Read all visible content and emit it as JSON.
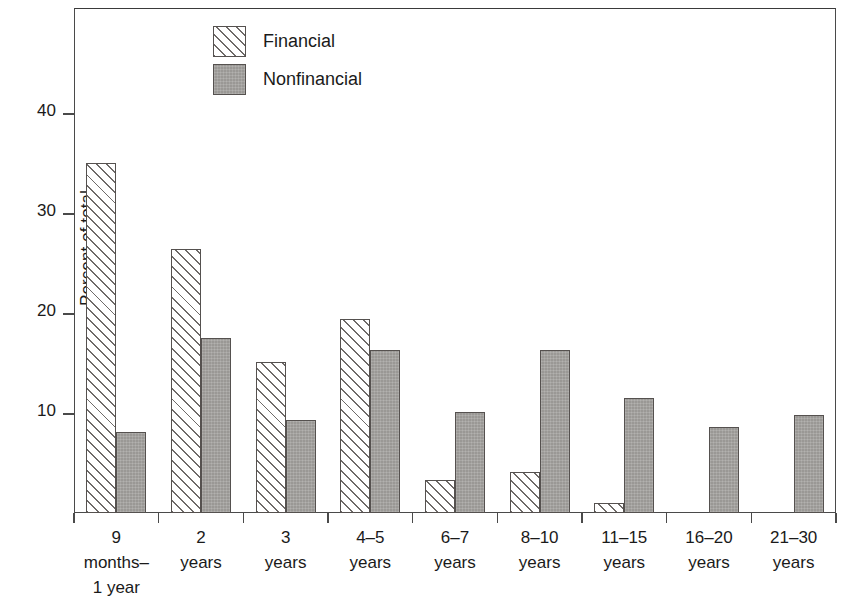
{
  "chart_data": {
    "type": "bar",
    "title": "",
    "xlabel": "",
    "ylabel": "Percent of total",
    "ylim": [
      0,
      50
    ],
    "yticks": [
      10,
      20,
      30,
      40
    ],
    "ytick_labels": [
      "10",
      "20",
      "30",
      "40"
    ],
    "grid": false,
    "legend_position": "top-center",
    "categories": [
      "9\nmonths–\n1 year",
      "2\nyears",
      "3\nyears",
      "4–5\nyears",
      "6–7\nyears",
      "8–10\nyears",
      "11–15\nyears",
      "16–20\nyears",
      "21–30\nyears"
    ],
    "series": [
      {
        "name": "Financial",
        "fill": "diagonal-hatch",
        "values": [
          35.0,
          26.4,
          15.1,
          19.4,
          3.3,
          4.1,
          1.0,
          0,
          0
        ]
      },
      {
        "name": "Nonfinancial",
        "fill": "solid-gray",
        "values": [
          8.1,
          17.5,
          9.3,
          16.3,
          10.1,
          16.3,
          11.5,
          8.6,
          9.8
        ]
      }
    ]
  },
  "legend": {
    "items": [
      {
        "label": "Financial",
        "swatch": "hatched-swatch-icon"
      },
      {
        "label": "Nonfinancial",
        "swatch": "gray-swatch-icon"
      }
    ]
  },
  "axes": {
    "y_title": "Percent of total"
  },
  "colors": {
    "hatch_line": "#6e6a68",
    "gray_fill": "#9a9895",
    "bar_outline": "#55514f",
    "axis": "#4a4a4a",
    "text": "#1a1a1a",
    "background": "#ffffff"
  }
}
